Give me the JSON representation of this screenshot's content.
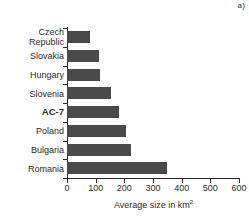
{
  "panel": {
    "letter": "a)"
  },
  "chart_data": {
    "type": "bar",
    "orientation": "horizontal",
    "title": "",
    "xlabel": "Average size in km2",
    "xlabel_base": "Average size in km",
    "xlabel_sup": "2",
    "ylabel": "",
    "xlim": [
      0,
      600
    ],
    "xticks": [
      0,
      100,
      200,
      300,
      400,
      500,
      600
    ],
    "xtick_labels": [
      "0",
      "100",
      "200",
      "300",
      "400",
      "500",
      "600"
    ],
    "grid": false,
    "legend": "none",
    "bar_color": "#4a4a4a",
    "axis_color": "#2b2b2b",
    "categories": [
      "Czech\nRepublic",
      "Slovakia",
      "Hungary",
      "Slovenia",
      "AC-7",
      "Poland",
      "Bulgaria",
      "Romania"
    ],
    "category_labels_plain": [
      "Czech Republic",
      "Slovakia",
      "Hungary",
      "Slovenia",
      "AC-7",
      "Poland",
      "Bulgaria",
      "Romania"
    ],
    "emphasized_categories": [
      "AC-7"
    ],
    "values": [
      81,
      112,
      115,
      153,
      182,
      207,
      222,
      350
    ]
  }
}
